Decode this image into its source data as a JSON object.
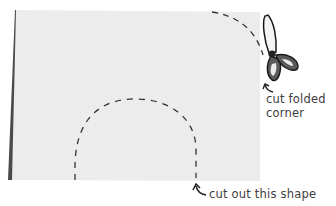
{
  "diagram": {
    "type": "paper-cutting-instructions",
    "colors": {
      "paper": "#ececec",
      "paper_fold_edge": "#4a4a4a",
      "cut_line": "#333333",
      "scissors_fill": "#5a5a5a",
      "scissors_outline": "#1a1a1a",
      "text": "#3d3d3d"
    },
    "labels": {
      "fold_corner_line1": "cut folded",
      "fold_corner_line2": "corner",
      "shape": "cut out this shape"
    },
    "icons": {
      "scissors": "scissors-icon",
      "arrow_corner": "curved-arrow-icon",
      "arrow_shape": "curved-arrow-icon"
    }
  }
}
